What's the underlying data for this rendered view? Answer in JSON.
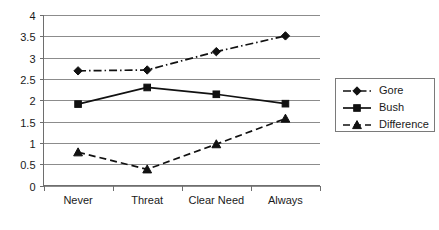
{
  "chart_data": {
    "type": "line",
    "title": "",
    "subtitle": "",
    "xlabel": "",
    "ylabel": "",
    "categories": [
      "Never",
      "Threat",
      "Clear Need",
      "Always"
    ],
    "ylim": [
      0,
      4
    ],
    "ytick_labels": [
      "0",
      "0.5",
      "1",
      "1.5",
      "2",
      "2.5",
      "3",
      "3.5",
      "4"
    ],
    "ytick_values": [
      0,
      0.5,
      1,
      1.5,
      2,
      2.5,
      3,
      3.5,
      4
    ],
    "grid": true,
    "grid_axis": "y",
    "legend_position": "right",
    "series": [
      {
        "name": "Gore",
        "values": [
          2.69,
          2.71,
          3.14,
          3.51
        ],
        "line_style": "dash-dot",
        "marker": "diamond",
        "color": "#111111"
      },
      {
        "name": "Bush",
        "values": [
          1.91,
          2.3,
          2.14,
          1.92
        ],
        "line_style": "solid",
        "marker": "square",
        "color": "#111111"
      },
      {
        "name": "Difference",
        "values": [
          0.78,
          0.38,
          0.97,
          1.57
        ],
        "line_style": "dashed",
        "marker": "triangle",
        "color": "#111111"
      }
    ]
  },
  "legend": {
    "entries": [
      {
        "label": "Gore"
      },
      {
        "label": "Bush"
      },
      {
        "label": "Difference"
      }
    ]
  },
  "colors": {
    "series": "#111111",
    "gridline": "#8c8c8c",
    "axis": "#6e6e6e",
    "background": "#ffffff",
    "text": "#1a1a1a"
  }
}
